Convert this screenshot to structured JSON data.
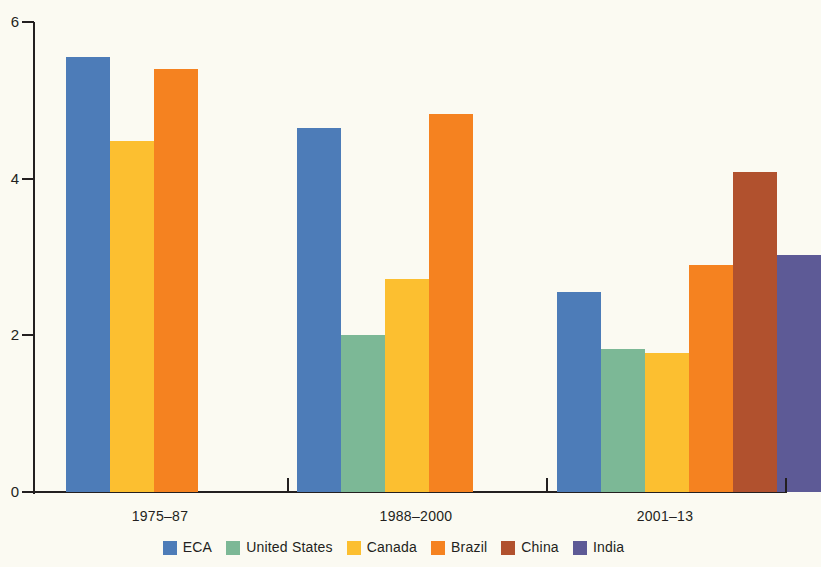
{
  "chart_data": {
    "type": "bar",
    "title": "",
    "subtitle": "",
    "xlabel": "",
    "ylabel": "",
    "grid": false,
    "legend_position": "bottom",
    "categories": [
      "1975–87",
      "1988–2000",
      "2001–13"
    ],
    "ylim": [
      0,
      6
    ],
    "yticks": [
      0,
      2,
      4,
      6
    ],
    "ytick_labels": [
      "0",
      "2",
      "4",
      "6"
    ],
    "series": [
      {
        "name": "ECA",
        "color": "#4d7cb8",
        "values": [
          5.55,
          4.65,
          2.55
        ]
      },
      {
        "name": "United States",
        "color": "#7cb896",
        "values": [
          null,
          2.0,
          1.82
        ]
      },
      {
        "name": "Canada",
        "color": "#fcbf30",
        "values": [
          4.48,
          2.72,
          1.77
        ]
      },
      {
        "name": "Brazil",
        "color": "#f58220",
        "values": [
          5.4,
          4.82,
          2.9
        ]
      },
      {
        "name": "China",
        "color": "#b1512e",
        "values": [
          null,
          null,
          4.08
        ]
      },
      {
        "name": "India",
        "color": "#5d5a96",
        "values": [
          null,
          null,
          3.02
        ]
      }
    ]
  },
  "axis": {
    "y_tick_labels": [
      "6",
      "4",
      "2",
      "0"
    ]
  },
  "group_labels": [
    "1975–87",
    "1988–2000",
    "2001–13"
  ],
  "legend": {
    "items": [
      {
        "label": "ECA",
        "color": "#4d7cb8"
      },
      {
        "label": "United States",
        "color": "#7cb896"
      },
      {
        "label": "Canada",
        "color": "#fcbf30"
      },
      {
        "label": "Brazil",
        "color": "#f58220"
      },
      {
        "label": "China",
        "color": "#b1512e"
      },
      {
        "label": "India",
        "color": "#5d5a96"
      }
    ]
  }
}
